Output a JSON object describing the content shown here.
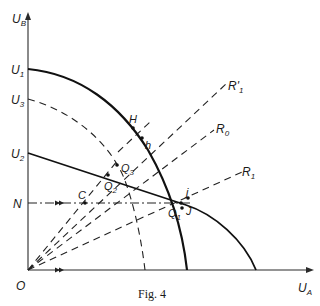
{
  "figure": {
    "caption": "Fig. 4",
    "axes": {
      "y_label": "U",
      "y_sub": "B",
      "x_label": "U",
      "x_sub": "A",
      "origin_label": "O"
    },
    "y_ticks": [
      {
        "name": "U",
        "sub": "1",
        "kind": "solid curve intercept"
      },
      {
        "name": "U",
        "sub": "3",
        "kind": "dashed curve intercept"
      },
      {
        "name": "U",
        "sub": "2",
        "kind": "solid curve intercept"
      },
      {
        "name": "N",
        "sub": "",
        "kind": "dash-dot horizontal line"
      }
    ],
    "rays": [
      {
        "name": "R'",
        "sub": "1"
      },
      {
        "name": "R",
        "sub": "0"
      },
      {
        "name": "R",
        "sub": "1"
      }
    ],
    "points": [
      {
        "name": "H",
        "sub": ""
      },
      {
        "name": "h",
        "sub": ""
      },
      {
        "name": "Q",
        "sub": "3"
      },
      {
        "name": "Q",
        "sub": "2"
      },
      {
        "name": "C",
        "sub": ""
      },
      {
        "name": "j",
        "sub": ""
      },
      {
        "name": "J",
        "sub": ""
      },
      {
        "name": "Q",
        "sub": "1"
      }
    ],
    "curves": [
      {
        "id": "U1-frontier",
        "style": "solid thick",
        "from": "U1 on vertical axis",
        "to": "horizontal axis"
      },
      {
        "id": "U3-frontier",
        "style": "dashed",
        "from": "U3 on vertical axis",
        "to": "horizontal axis"
      },
      {
        "id": "U2-frontier",
        "style": "solid thick",
        "from": "U2 on vertical axis",
        "to": "horizontal axis"
      }
    ]
  }
}
